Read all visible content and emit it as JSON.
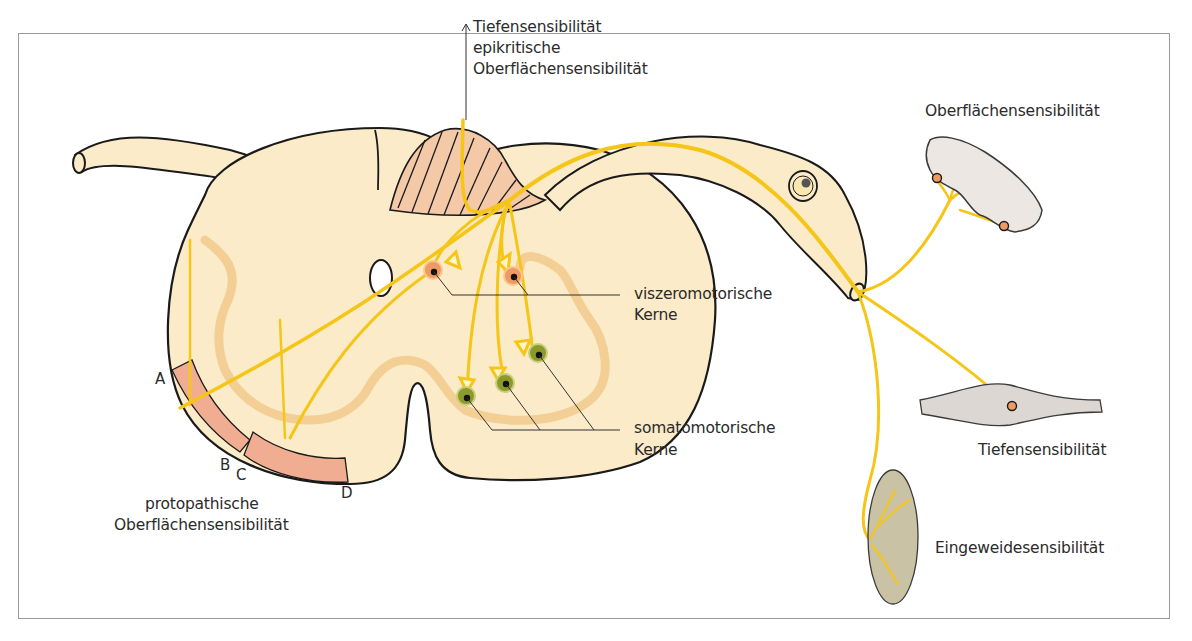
{
  "figure": {
    "type": "spinal-cord-cross-section",
    "colors": {
      "tissue": "#fbebc8",
      "outline": "#1a1a1a",
      "nerve_fiber": "#f5c518",
      "gray_matter_outline": "#f3cf95",
      "tract_fill": "#f0ad92",
      "dorsal_column_fill": "#f3c9a7",
      "visceromotor_nucleus": "#ef9a62",
      "somatomotor_nucleus": "#8c9a2c",
      "skin": "#ece7e2",
      "muscle": "#dcd7d2",
      "viscera": "#c9c2a4"
    }
  },
  "labels": {
    "top_arrow": {
      "line1": "Tiefensensibilität",
      "line2": "epikritische",
      "line3": "Oberflächensensibilität"
    },
    "skin": "Oberflächensensibilität",
    "visceromotor": {
      "line1": "viszeromotorische",
      "line2": "Kerne"
    },
    "somatomotor": {
      "line1": "somatomotorische",
      "line2": "Kerne"
    },
    "muscle": "Tiefensensibilität",
    "viscera": "Eingeweidesensibilität",
    "protopathic": {
      "line1": "protopathische",
      "line2": "Oberflächensensibilität"
    },
    "tract_letters": {
      "a": "A",
      "b": "B",
      "c": "C",
      "d": "D"
    }
  }
}
